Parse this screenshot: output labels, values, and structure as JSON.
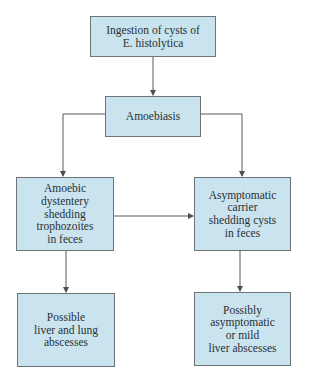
{
  "diagram": {
    "type": "flowchart",
    "colors": {
      "box_fill": "#c9e4ef",
      "box_border": "#6d7377",
      "line": "#555a5e",
      "text": "#2a3035"
    },
    "nodes": [
      {
        "id": "ingestion",
        "label": "Ingestion of cysts of\nE. histolytica"
      },
      {
        "id": "amoebiasis",
        "label": "Amoebiasis"
      },
      {
        "id": "dysentery",
        "label": "Amoebic\ndystentery\nshedding\ntrophozoites\nin feces"
      },
      {
        "id": "carrier",
        "label": "Asymptomatic\ncarrier\nshedding cysts\nin feces"
      },
      {
        "id": "liver_lung",
        "label": "Possible\nliver and lung\nabscesses"
      },
      {
        "id": "mild_liver",
        "label": "Possibly\nasymptomatic\nor mild\nliver abscesses"
      }
    ],
    "edges": [
      {
        "from": "ingestion",
        "to": "amoebiasis"
      },
      {
        "from": "amoebiasis",
        "to": "dysentery"
      },
      {
        "from": "amoebiasis",
        "to": "carrier"
      },
      {
        "from": "dysentery",
        "to": "carrier"
      },
      {
        "from": "dysentery",
        "to": "liver_lung"
      },
      {
        "from": "carrier",
        "to": "mild_liver"
      }
    ]
  }
}
